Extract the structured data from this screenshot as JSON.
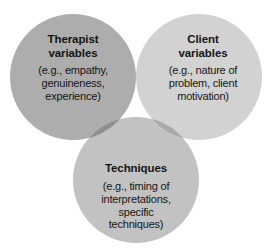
{
  "diagram": {
    "type": "venn",
    "set_count": 3,
    "background_color": "#ffffff",
    "text_color": "#151515",
    "sets": [
      {
        "id": "therapist",
        "title": "Therapist\nvariables",
        "title_line_1": "Therapist",
        "title_line_2": "variables",
        "detail": "(e.g., empathy,\ngenuineness,\nexperience)",
        "detail_line_1": "(e.g., empathy,",
        "detail_line_2": "genuineness,",
        "detail_line_3": "experience)",
        "position": "top-left",
        "fill_color": "#adadad"
      },
      {
        "id": "client",
        "title": "Client\nvariables",
        "title_line_1": "Client",
        "title_line_2": "variables",
        "detail": "(e.g., nature of\nproblem, client\nmotivation)",
        "detail_line_1": "(e.g., nature of",
        "detail_line_2": "problem, client",
        "detail_line_3": "motivation)",
        "position": "top-right",
        "fill_color": "#d2d2d2"
      },
      {
        "id": "techniques",
        "title": "Techniques",
        "title_line_1": "Techniques",
        "detail": "(e.g., timing of\ninterpretations,\nspecific\ntechniques)",
        "detail_line_1": "(e.g., timing of",
        "detail_line_2": "interpretations,",
        "detail_line_3": "specific",
        "detail_line_4": "techniques)",
        "position": "bottom-center",
        "fill_color": "#c2c2c2"
      }
    ],
    "overlaps": {
      "therapist_client": "#a2a2a2",
      "therapist_techniques": "#8f8f8f",
      "client_techniques": "#a9a9a9",
      "all_three": "#f2f0ea"
    }
  }
}
